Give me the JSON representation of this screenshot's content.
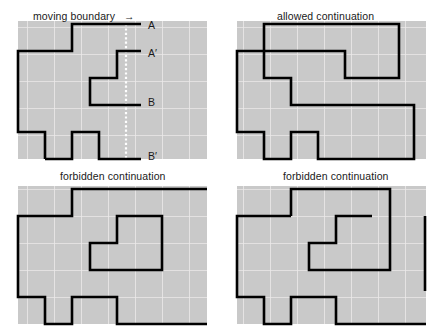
{
  "figure": {
    "type": "diagram",
    "width": 446,
    "height": 330,
    "background_color": "#ffffff",
    "panel_fill_color": "#c9c9c9",
    "grid_line_color": "#f0f0f0",
    "boundary_color": "#000000",
    "boundary_stroke_width": 2.6,
    "dotted_line_color": "#ffffff",
    "panel_layout": "2x2",
    "grid_cell_px": 27,
    "grid_columns": 7,
    "grid_rows": 5
  },
  "panels": [
    {
      "id": "top-left",
      "caption": "moving boundary",
      "has_arrow": true,
      "arrow_glyph": "→",
      "node_labels": [
        "A",
        "A′",
        "B",
        "B′"
      ],
      "has_dotted_scan_line": true
    },
    {
      "id": "top-right",
      "caption": "allowed continuation",
      "has_arrow": false,
      "node_labels": [],
      "has_dotted_scan_line": false
    },
    {
      "id": "bottom-left",
      "caption": "forbidden continuation",
      "has_arrow": false,
      "node_labels": [],
      "has_dotted_scan_line": false
    },
    {
      "id": "bottom-right",
      "caption": "forbidden continuation",
      "has_arrow": false,
      "node_labels": [],
      "has_dotted_scan_line": false
    }
  ],
  "labels": {
    "a": "A",
    "a_prime": "A′",
    "b": "B",
    "b_prime": "B′"
  }
}
